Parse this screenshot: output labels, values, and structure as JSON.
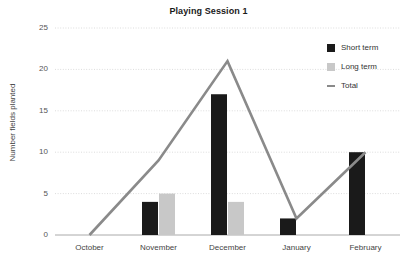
{
  "chart_data": {
    "type": "bar",
    "title": "Playing Session 1",
    "xlabel": "",
    "ylabel": "Number fields planted",
    "categories": [
      "October",
      "November",
      "December",
      "January",
      "February"
    ],
    "series": [
      {
        "name": "Short term",
        "type": "bar",
        "color": "#1a1a1a",
        "values": [
          0,
          4,
          17,
          2,
          10
        ]
      },
      {
        "name": "Long term",
        "type": "bar",
        "color": "#c8c8c8",
        "values": [
          0,
          5,
          4,
          0,
          0
        ]
      },
      {
        "name": "Total",
        "type": "line",
        "color": "#8a8a8a",
        "values": [
          0,
          9,
          21,
          2,
          10
        ]
      }
    ],
    "ylim": [
      0,
      25
    ],
    "yticks": [
      0,
      5,
      10,
      15,
      20,
      25
    ],
    "ytick_labels": [
      "0",
      "5",
      "10",
      "15",
      "20",
      "25"
    ],
    "grid": true,
    "grid_axis": "y",
    "legend_position": "top-right"
  },
  "legend": {
    "entries": [
      {
        "label": "Short term",
        "marker": "square",
        "color": "#1a1a1a"
      },
      {
        "label": "Long term",
        "marker": "square",
        "color": "#c8c8c8"
      },
      {
        "label": "Total",
        "marker": "line",
        "color": "#8a8a8a"
      }
    ]
  },
  "colors": {
    "background": "#ffffff",
    "short_term": "#1a1a1a",
    "long_term": "#c8c8c8",
    "total_line": "#8a8a8a",
    "gridline": "#dcdcdc",
    "axis": "#aaaaaa",
    "text": "#333333"
  }
}
